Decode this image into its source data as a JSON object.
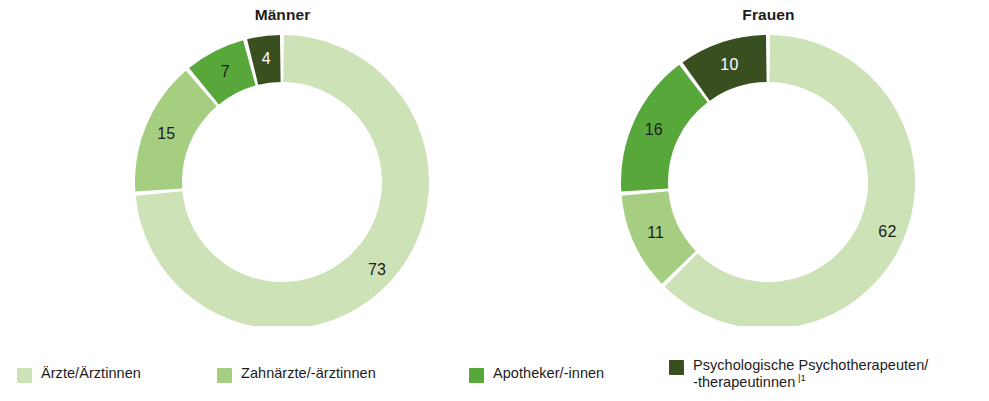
{
  "chart_data": {
    "type": "pie",
    "title": "",
    "subtitle": "",
    "xlabel": "",
    "ylabel": "",
    "legend_position": "bottom",
    "grid": false,
    "unit": "percent",
    "categories": [
      "Ärzte/Ärztinnen",
      "Zahnärzte/-ärztinnen",
      "Apotheker/-innen",
      "Psychologische Psychotherapeuten/-therapeutinnen"
    ],
    "colors": [
      "#cde2b6",
      "#a6ce81",
      "#57a73a",
      "#3a4f1f"
    ],
    "charts": [
      {
        "name": "Männer",
        "values": [
          73,
          15,
          7,
          4
        ],
        "labels": [
          "73",
          "15",
          "7",
          "4"
        ]
      },
      {
        "name": "Frauen",
        "values": [
          62,
          11,
          16,
          10
        ],
        "labels": [
          "62",
          "11",
          "16",
          "10"
        ]
      }
    ],
    "series": [
      {
        "name": "Männer",
        "values": [
          73,
          15,
          7,
          4
        ]
      },
      {
        "name": "Frauen",
        "values": [
          62,
          11,
          16,
          10
        ]
      }
    ]
  },
  "charts": {
    "maenner": {
      "title": "Männer",
      "slices": [
        {
          "label": "73",
          "value": 73,
          "color": "#cde2b6",
          "dark": false
        },
        {
          "label": "15",
          "value": 15,
          "color": "#a6ce81",
          "dark": false
        },
        {
          "label": "7",
          "value": 7,
          "color": "#57a73a",
          "dark": false
        },
        {
          "label": "4",
          "value": 4,
          "color": "#3a4f1f",
          "dark": true
        }
      ]
    },
    "frauen": {
      "title": "Frauen",
      "slices": [
        {
          "label": "62",
          "value": 62,
          "color": "#cde2b6",
          "dark": false
        },
        {
          "label": "11",
          "value": 11,
          "color": "#a6ce81",
          "dark": false
        },
        {
          "label": "16",
          "value": 16,
          "color": "#57a73a",
          "dark": false
        },
        {
          "label": "10",
          "value": 10,
          "color": "#3a4f1f",
          "dark": true
        }
      ]
    }
  },
  "legend": {
    "items": [
      {
        "label": "Ärzte/Ärztinnen",
        "color": "#cde2b6",
        "footnote": ""
      },
      {
        "label": "Zahnärzte/-ärztinnen",
        "color": "#a6ce81",
        "footnote": ""
      },
      {
        "label": "Apotheker/-innen",
        "color": "#57a73a",
        "footnote": ""
      },
      {
        "label": "Psychologische Psychotherapeuten/\n-therapeutinnen",
        "color": "#3a4f1f",
        "footnote": "|1"
      }
    ]
  }
}
